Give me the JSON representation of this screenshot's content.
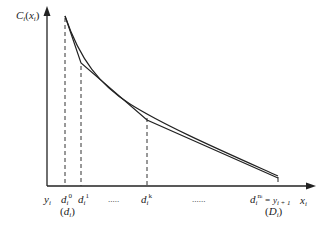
{
  "diagram": {
    "y_axis_label": {
      "main": "C",
      "sub": "i",
      "arg": "x",
      "arg_sub": "i"
    },
    "x_axis_label": {
      "main": "x",
      "sub": "i"
    },
    "tick_labels": [
      {
        "id": "yi",
        "main": "y",
        "sub": "i",
        "sup": ""
      },
      {
        "id": "d0",
        "main": "d",
        "sub": "i",
        "sup": "0",
        "under": "(d",
        "under_sub": "i",
        "under_close": ")"
      },
      {
        "id": "d1",
        "main": "d",
        "sub": "i",
        "sup": "1"
      },
      {
        "id": "dots1",
        "text": "....."
      },
      {
        "id": "dk",
        "main": "d",
        "sub": "i",
        "sup": "k"
      },
      {
        "id": "dots2",
        "text": "......"
      },
      {
        "id": "dn",
        "main": "d",
        "sub": "i",
        "sup": "n",
        "sup_sub": "i",
        "eq": "= y",
        "eq_sub": "i + 1",
        "under": "(D",
        "under_sub": "i",
        "under_close": ")"
      }
    ],
    "colors": {
      "line": "#222222",
      "dash": "#333333",
      "background": "#ffffff"
    }
  }
}
